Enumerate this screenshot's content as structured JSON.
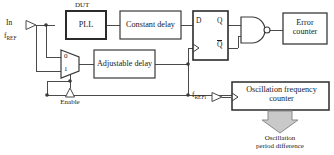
{
  "diagram": {
    "colors": {
      "line": "#4a4a4a",
      "box_border": "#3a3a3a",
      "dut_border": "#2b2b2b",
      "text": "#1a1a1a",
      "arrow_fill": "#c9c9c9",
      "arrow_stroke": "#8a8a8a",
      "background": "#ffffff"
    },
    "inputs": [
      {
        "id": "in",
        "label": "In",
        "port": "input-port-triangle"
      },
      {
        "id": "fref",
        "label": "f",
        "subscript": "REF"
      },
      {
        "id": "enable",
        "label": "Enable",
        "port": "input-port-triangle"
      },
      {
        "id": "frefi",
        "label": "f",
        "subscript": "REFi",
        "port": "input-port-triangle"
      }
    ],
    "blocks": [
      {
        "id": "pll",
        "label": "PLL",
        "group_label": "DUT"
      },
      {
        "id": "constant_delay",
        "label": "Constant delay"
      },
      {
        "id": "adjustable_delay",
        "label": "Adjustable delay"
      },
      {
        "id": "error_counter",
        "label_line1": "Error",
        "label_line2": "counter"
      },
      {
        "id": "osc_counter",
        "label_line1": "Oscillation frequency",
        "label_line2": "counter"
      }
    ],
    "mux": {
      "id": "multiplexer",
      "input_labels": [
        "0",
        "1"
      ],
      "select_label": "Enable"
    },
    "flipflop": {
      "id": "d-flip-flop",
      "pins": {
        "d": "D",
        "q": "Q",
        "qbar": "Q",
        "clock": "clock-triangle"
      }
    },
    "gate": {
      "id": "nand-gate",
      "type": "NAND",
      "bubble": true
    },
    "output_annotation": {
      "arrow": "down-block-arrow",
      "label_line1": "Oscillation",
      "label_line2": "period difference"
    }
  }
}
